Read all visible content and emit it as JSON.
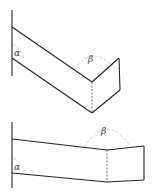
{
  "figures": [
    {
      "name": "folded-plate-top",
      "labels": {
        "alpha": "α",
        "beta": "β"
      }
    },
    {
      "name": "folded-plate-bottom",
      "labels": {
        "alpha": "α",
        "beta": "β"
      }
    }
  ]
}
